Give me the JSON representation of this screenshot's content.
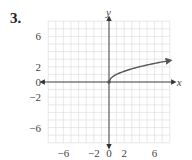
{
  "problem": {
    "number": "3."
  },
  "chart_data": {
    "type": "line",
    "title": "",
    "xlabel": "x",
    "ylabel": "y",
    "xlim": [
      -8,
      8
    ],
    "ylim": [
      -8,
      8
    ],
    "grid": true,
    "x_ticks": [
      "-6",
      "-2",
      "0",
      "2",
      "6"
    ],
    "y_ticks": [
      "6",
      "2",
      "0",
      "-2",
      "-6"
    ],
    "series": [
      {
        "name": "y = sqrt(x)",
        "x": [
          0,
          0.5,
          1,
          2,
          3,
          4,
          5,
          6,
          7,
          8
        ],
        "y": [
          0,
          0.71,
          1,
          1.41,
          1.73,
          2,
          2.24,
          2.45,
          2.65,
          2.83
        ],
        "start_point": [
          0,
          0
        ],
        "end_arrow": true
      }
    ],
    "colors": {
      "curve": "#555555",
      "axes": "#333333",
      "grid": "#d9d9d9"
    }
  }
}
